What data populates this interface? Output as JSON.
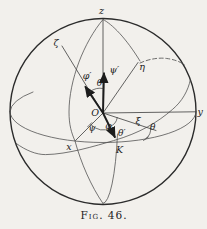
{
  "figure": {
    "caption": "Fig. 46."
  },
  "labels": {
    "z_axis": "z",
    "zeta_axis": "ζ",
    "eta_axis": "η",
    "y_axis": "y",
    "x_axis": "x",
    "xi_axis": "ξ",
    "node_point": "K",
    "origin": "O",
    "psi_rate": "ψ′",
    "phi_rate": "φ′",
    "theta_rate": "θ′",
    "theta_polar": "θ",
    "theta_node": "θ",
    "psi_angle": "ψ",
    "phi_angle": "φ"
  },
  "colors": {
    "ink": "#2b2b2b",
    "thin_line": "#4a4a4a",
    "paper": "#f2f0ec"
  }
}
